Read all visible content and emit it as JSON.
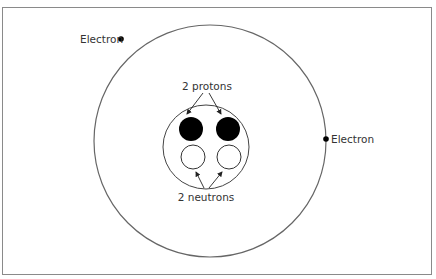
{
  "diagram": {
    "labels": {
      "electron_left": "Electron",
      "electron_right": "Electron",
      "protons": "2 protons",
      "neutrons": "2 neutrons"
    },
    "outer_orbit": {
      "cx": 210,
      "cy": 141,
      "r": 116
    },
    "nucleus": {
      "cx": 206,
      "cy": 147,
      "rx": 43,
      "ry": 42
    },
    "protons": [
      {
        "cx": 191,
        "cy": 129,
        "r": 12
      },
      {
        "cx": 228,
        "cy": 129,
        "r": 12
      }
    ],
    "neutrons": [
      {
        "cx": 193,
        "cy": 157,
        "r": 12
      },
      {
        "cx": 229,
        "cy": 157,
        "r": 12
      }
    ],
    "electrons": [
      {
        "cx": 121,
        "cy": 39
      },
      {
        "cx": 326,
        "cy": 139
      }
    ],
    "colors": {
      "stroke": "#555555",
      "proton_fill": "#000000",
      "neutron_fill": "#ffffff",
      "frame": "#8a8a8a"
    }
  }
}
